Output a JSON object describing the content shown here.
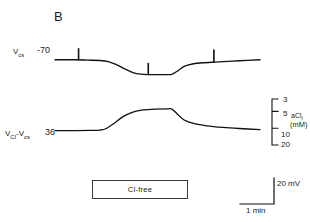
{
  "figure": {
    "panel_letter": "B",
    "traces": [
      {
        "name": "membrane-potential",
        "label": "V",
        "label_sub": "cs",
        "baseline_value": "-70",
        "units": "mV",
        "description": "Membrane potential hyperpolarizes during Cl-free exposure",
        "spikes_x": [
          72,
          150,
          225
        ]
      },
      {
        "name": "chloride-electrode-potential",
        "label_part1": "V",
        "label_sub1": "Cl",
        "label_dash": "-",
        "label_part2": "V",
        "label_sub2": "cs",
        "baseline_value": "36",
        "units": "mV",
        "description": "Cl-selective microelectrode differential potential rises as intracellular chloride falls"
      }
    ],
    "right_axis": {
      "name": "aCl",
      "name_sub": "i",
      "unit": "(mM)",
      "ticks": [
        "3",
        "5",
        "10",
        "20"
      ]
    },
    "treatment_bar": {
      "label": "Cl-free"
    },
    "calibration": {
      "vertical_label": "20 mV",
      "horizontal_label": "1 min"
    }
  },
  "chart_data": {
    "type": "line",
    "title": "B",
    "xlabel": "",
    "ylabel": "",
    "grid": false,
    "legend": false,
    "xlim": [
      0,
      10
    ],
    "x_unit": "min",
    "annotations": [
      {
        "text": "Cl-free",
        "x_start": 2.2,
        "x_end": 5.6,
        "type": "treatment-bar"
      },
      {
        "text": "20 mV",
        "type": "vertical-calibration"
      },
      {
        "text": "1 min",
        "type": "horizontal-calibration"
      }
    ],
    "series": [
      {
        "name": "V_cs",
        "ylabel": "V_cs (mV)",
        "baseline": -70,
        "ylim": [
          -85,
          -62
        ],
        "points": [
          {
            "x": 0.0,
            "y": -70.0
          },
          {
            "x": 1.0,
            "y": -70.0
          },
          {
            "x": 1.6,
            "y": -70.3
          },
          {
            "x": 2.2,
            "y": -70.6
          },
          {
            "x": 2.6,
            "y": -71.5
          },
          {
            "x": 3.0,
            "y": -74.0
          },
          {
            "x": 3.4,
            "y": -77.5
          },
          {
            "x": 3.8,
            "y": -80.5
          },
          {
            "x": 4.2,
            "y": -81.8
          },
          {
            "x": 4.8,
            "y": -82.2
          },
          {
            "x": 5.4,
            "y": -82.2
          },
          {
            "x": 5.7,
            "y": -82.0
          },
          {
            "x": 6.0,
            "y": -79.0
          },
          {
            "x": 6.3,
            "y": -75.5
          },
          {
            "x": 6.7,
            "y": -73.5
          },
          {
            "x": 7.2,
            "y": -72.5
          },
          {
            "x": 8.0,
            "y": -71.8
          },
          {
            "x": 9.0,
            "y": -70.8
          },
          {
            "x": 10.0,
            "y": -70.0
          }
        ],
        "spikes": [
          {
            "x": 1.15,
            "amplitude_mv": 9
          },
          {
            "x": 4.55,
            "amplitude_mv": 9
          },
          {
            "x": 7.75,
            "amplitude_mv": 10
          }
        ]
      },
      {
        "name": "V_Cl - V_cs",
        "ylabel": "V_Cl - V_cs (mV)",
        "baseline": 36,
        "ylim": [
          30,
          62
        ],
        "points": [
          {
            "x": 0.0,
            "y": 36.0
          },
          {
            "x": 1.0,
            "y": 36.0
          },
          {
            "x": 1.8,
            "y": 36.2
          },
          {
            "x": 2.2,
            "y": 36.5
          },
          {
            "x": 2.5,
            "y": 38.0
          },
          {
            "x": 2.9,
            "y": 43.0
          },
          {
            "x": 3.3,
            "y": 49.0
          },
          {
            "x": 3.8,
            "y": 53.5
          },
          {
            "x": 4.3,
            "y": 55.5
          },
          {
            "x": 4.9,
            "y": 56.3
          },
          {
            "x": 5.5,
            "y": 56.5
          },
          {
            "x": 5.7,
            "y": 56.3
          },
          {
            "x": 5.95,
            "y": 52.0
          },
          {
            "x": 6.3,
            "y": 46.0
          },
          {
            "x": 6.8,
            "y": 42.5
          },
          {
            "x": 7.4,
            "y": 40.5
          },
          {
            "x": 8.2,
            "y": 39.0
          },
          {
            "x": 9.0,
            "y": 38.0
          },
          {
            "x": 10.0,
            "y": 37.0
          }
        ]
      }
    ],
    "secondary_axis": {
      "name": "aCl_i",
      "unit": "mM",
      "scale": "log-inverted",
      "tick_values": [
        3,
        5,
        10,
        20
      ],
      "tick_labels": [
        "3",
        "5",
        "10",
        "20"
      ]
    }
  }
}
